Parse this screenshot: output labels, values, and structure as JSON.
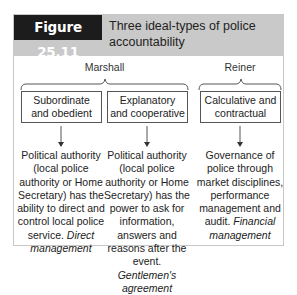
{
  "figure": {
    "number": "Figure 25.11",
    "title": "Three ideal-types of police accountability"
  },
  "groups": [
    {
      "label": "Marshall"
    },
    {
      "label": "Reiner"
    }
  ],
  "types": [
    {
      "label": "Subordinate and obedient",
      "description": "Political authority (local police authority or Home Secretary) has the ability to direct and control local police service.",
      "term": "Direct management"
    },
    {
      "label": "Explanatory and cooperative",
      "description": "Political authority (local police authority or Home Secretary) has the power to ask for information, answers and reasons after the event.",
      "term": "Gentlemen's agreement"
    },
    {
      "label": "Calculative and contractual",
      "description": "Governance of police through market disciplines, performance management and audit.",
      "term": "Financial management"
    }
  ],
  "colors": {
    "header_bg": "#c9c9c9",
    "label_bg": "#1c1c1c",
    "border": "#555555"
  }
}
